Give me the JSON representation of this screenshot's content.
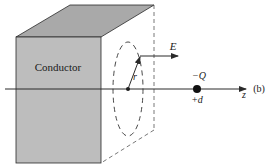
{
  "figure": {
    "panel_label": "(b)",
    "conductor_label": "Conductor",
    "field_label": "E",
    "radius_label": "r",
    "charge_label": "−Q",
    "position_label": "+d",
    "axis_label": "z"
  },
  "colors": {
    "conductor_front": "#bdbdbd",
    "conductor_top": "#a9a9a9",
    "line": "#2a2a2a",
    "dashed": "#555555"
  }
}
